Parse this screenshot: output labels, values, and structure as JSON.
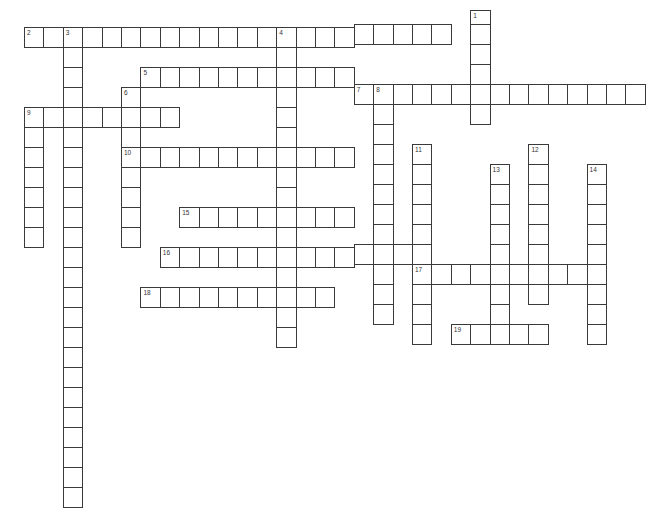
{
  "puzzle": {
    "type": "crossword",
    "entries": [
      {
        "number": "1",
        "direction": "down",
        "col": 23,
        "row": -1,
        "length": 6
      },
      {
        "number": "2",
        "direction": "across",
        "col": 0,
        "row": 0,
        "length": 22
      },
      {
        "number": "3",
        "direction": "down",
        "col": 2,
        "row": 0,
        "length": 24
      },
      {
        "number": "4",
        "direction": "down",
        "col": 13,
        "row": 0,
        "length": 16
      },
      {
        "number": "5",
        "direction": "across",
        "col": 6,
        "row": 2,
        "length": 11
      },
      {
        "number": "6",
        "direction": "down",
        "col": 5,
        "row": 3,
        "length": 8
      },
      {
        "number": "7",
        "direction": "across",
        "col": 17,
        "row": 3,
        "length": 15
      },
      {
        "number": "8",
        "direction": "down",
        "col": 18,
        "row": 3,
        "length": 12
      },
      {
        "number": "9",
        "direction": "across",
        "col": 0,
        "row": 4,
        "length": 8
      },
      {
        "number": "9",
        "direction": "down",
        "col": 0,
        "row": 4,
        "length": 7
      },
      {
        "number": "10",
        "direction": "across",
        "col": 5,
        "row": 6,
        "length": 12
      },
      {
        "number": "11",
        "direction": "down",
        "col": 20,
        "row": 6,
        "length": 10
      },
      {
        "number": "12",
        "direction": "down",
        "col": 26,
        "row": 6,
        "length": 8
      },
      {
        "number": "13",
        "direction": "down",
        "col": 24,
        "row": 7,
        "length": 9
      },
      {
        "number": "14",
        "direction": "down",
        "col": 29,
        "row": 7,
        "length": 9
      },
      {
        "number": "15",
        "direction": "across",
        "col": 8,
        "row": 9,
        "length": 9
      },
      {
        "number": "16",
        "direction": "across",
        "col": 7,
        "row": 11,
        "length": 14
      },
      {
        "number": "17",
        "direction": "across",
        "col": 20,
        "row": 12,
        "length": 10
      },
      {
        "number": "18",
        "direction": "across",
        "col": 6,
        "row": 13,
        "length": 10
      },
      {
        "number": "19",
        "direction": "across",
        "col": 22,
        "row": 15,
        "length": 5
      }
    ],
    "colors": {
      "line": "#3a3a3a",
      "background": "#ffffff",
      "number": "#333333"
    }
  }
}
